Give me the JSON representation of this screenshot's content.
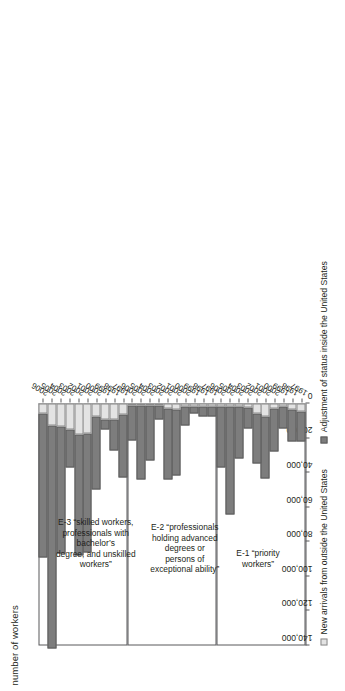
{
  "axis": {
    "title": "number of workers",
    "tick_labels": [
      "140,000",
      "120,000",
      "100,000",
      "80,000",
      "60,000",
      "40,000",
      "20,000",
      "0"
    ],
    "tick_values": [
      140000,
      120000,
      100000,
      80000,
      60000,
      40000,
      20000,
      0
    ]
  },
  "legend": {
    "entries": [
      {
        "label": "New arrivals from outside the United States",
        "swatch": "light-square-icon",
        "color": "#e3e3e3"
      },
      {
        "label": "Adjustment of status inside the United States",
        "swatch": "dark-square-icon",
        "color": "#7d7d7d"
      }
    ]
  },
  "panels": [
    {
      "id": "E-1",
      "title": "E-1 “priority\nworkers”"
    },
    {
      "id": "E-2",
      "title": "E-2 “professionals\nholding advanced degrees or\npersons of exceptional ability”"
    },
    {
      "id": "E-3",
      "title": "E-3 “skilled workers,\nprofessionals with bachelor’s\ndegree, and unskilled workers”"
    }
  ],
  "chart_data": {
    "type": "bar",
    "orientation": "horizontal-stacked",
    "title": "",
    "xlabel": "number of workers",
    "ylabel": "",
    "xlim": [
      0,
      140000
    ],
    "grid": false,
    "legend_position": "bottom",
    "categories": [
      "1997",
      "1998",
      "1999",
      "2000",
      "2001",
      "2002",
      "2003",
      "2004",
      "2005",
      "2006"
    ],
    "series_names": [
      "New arrivals from outside the United States",
      "Adjustment of status inside the United States"
    ],
    "panels": [
      {
        "name": "E-1 “priority workers”",
        "series": [
          {
            "name": "New arrivals from outside the United States",
            "values": [
              4500,
              3500,
              2000,
              3000,
              7500,
              5500,
              2500,
              2000,
              2000,
              1500
            ]
          },
          {
            "name": "Adjustment of status inside the United States",
            "values": [
              17500,
              18500,
              12500,
              24500,
              36000,
              29500,
              12000,
              30000,
              62500,
              35500
            ]
          }
        ],
        "totals": [
          22000,
          22000,
          14500,
          27500,
          43500,
          35000,
          14500,
          32000,
          64500,
          37000
        ]
      },
      {
        "name": "E-2 “professionals holding advanced degrees or persons of exceptional ability”",
        "series": [
          {
            "name": "New arrivals from outside the United States",
            "values": [
              1500,
              1500,
              1500,
              1500,
              3500,
              3000,
              1000,
              1000,
              1000,
              1000
            ]
          },
          {
            "name": "Adjustment of status inside the United States",
            "values": [
              6000,
              6000,
              4000,
              11000,
              38000,
              41000,
              8500,
              32000,
              43000,
              20500
            ]
          }
        ],
        "totals": [
          7500,
          7500,
          5500,
          12500,
          41500,
          44000,
          9500,
          33000,
          44000,
          21500
        ]
      },
      {
        "name": "E-3 “skilled workers, professionals with bachelor’s degree, and unskilled workers”",
        "series": [
          {
            "name": "New arrivals from outside the United States",
            "values": [
              6500,
              9500,
              9000,
              7500,
              17500,
              18000,
              15000,
              13500,
              13000,
              6000
            ]
          },
          {
            "name": "Adjustment of status inside the United States",
            "values": [
              36500,
              17500,
              6000,
              42500,
              68500,
              70000,
              22000,
              73000,
              129000,
              83000
            ]
          }
        ],
        "totals": [
          43000,
          27000,
          15000,
          50000,
          86000,
          88000,
          37000,
          86500,
          142000,
          89000
        ]
      }
    ]
  }
}
